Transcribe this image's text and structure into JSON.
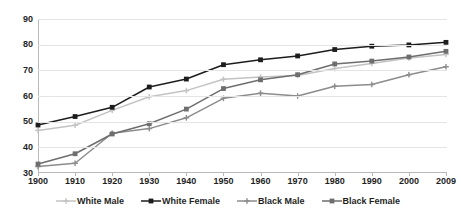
{
  "chart_data": {
    "type": "line",
    "title": "",
    "subtitle": "",
    "xlabel": "",
    "ylabel": "",
    "categories": [
      "1900",
      "1910",
      "1920",
      "1930",
      "1940",
      "1950",
      "1960",
      "1970",
      "1980",
      "1990",
      "2000",
      "2009"
    ],
    "x": [
      1900,
      1910,
      1920,
      1930,
      1940,
      1950,
      1960,
      1970,
      1980,
      1990,
      2000,
      2009
    ],
    "ylim": [
      30,
      90
    ],
    "xlim": [
      "1900",
      "2009"
    ],
    "ytick_labels": [
      "30",
      "40",
      "50",
      "60",
      "70",
      "80",
      "90"
    ],
    "ytick_values": [
      30,
      40,
      50,
      60,
      70,
      80,
      90
    ],
    "grid": "horizontal",
    "legend_position": "bottom",
    "series": [
      {
        "name": "White Male",
        "color": "#c3c3c3",
        "marker": "cross",
        "values": [
          46.6,
          48.6,
          54.4,
          59.7,
          62.1,
          66.5,
          67.4,
          68.0,
          70.7,
          72.7,
          74.8,
          76.2
        ]
      },
      {
        "name": "White Female",
        "color": "#1d1d1d",
        "marker": "square",
        "values": [
          48.7,
          52.0,
          55.6,
          63.5,
          66.6,
          72.2,
          74.1,
          75.6,
          78.1,
          79.4,
          79.9,
          80.9
        ]
      },
      {
        "name": "Black Male",
        "color": "#8c8c8c",
        "marker": "cross",
        "values": [
          32.5,
          33.8,
          45.5,
          47.3,
          51.5,
          59.1,
          61.1,
          60.0,
          63.8,
          64.5,
          68.3,
          71.4
        ]
      },
      {
        "name": "Black Female",
        "color": "#6e6e6e",
        "marker": "square",
        "values": [
          33.5,
          37.5,
          45.2,
          49.2,
          54.9,
          62.9,
          66.3,
          68.3,
          72.5,
          73.6,
          75.2,
          77.4
        ]
      }
    ]
  },
  "legend": {
    "items": [
      {
        "label": "White Male"
      },
      {
        "label": "White Female"
      },
      {
        "label": "Black Male"
      },
      {
        "label": "Black Female"
      }
    ]
  }
}
